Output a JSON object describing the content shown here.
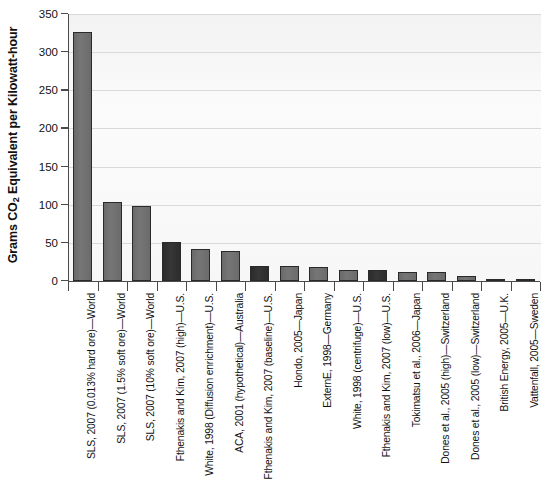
{
  "chart_data": {
    "type": "bar",
    "title": "",
    "xlabel": "",
    "ylabel": "Grams CO2 Equivalent per Kilowatt-hour",
    "ylabel_parts": {
      "pre": "Grams CO",
      "sub": "2",
      "post": " Equivalent per Kilowatt-hour"
    },
    "ylim": [
      0,
      350
    ],
    "yticks": [
      0,
      50,
      100,
      150,
      200,
      250,
      300,
      350
    ],
    "ytick_labels": [
      "0",
      "50",
      "100",
      "150",
      "200",
      "250",
      "300",
      "350"
    ],
    "grid": true,
    "legend": "none",
    "categories": [
      "SLS, 2007 (0.013% hard ore)—World",
      "SLS, 2007 (1.5% soft ore)—World",
      "SLS, 2007 (10% soft ore)—World",
      "Fthenakis and Kim, 2007 (high)—U.S.",
      "White, 1998 (Diffusion enrichment)—U.S.",
      "ACA, 2001 (hypothetical)—Australia",
      "Fthenakis and Kim, 2007 (baseline)—U.S.",
      "Hondo, 2005—Japan",
      "ExternE, 1998—Germany",
      "White, 1998 (centrifuge)—U.S.",
      "Fthenakis and Kim, 2007 (low)—U.S.",
      "Tokimatsu et al., 2006—Japan",
      "Dones et al., 2005 (high)—Switzerland",
      "Dones et al., 2005 (low)—Switzerland",
      "British Energy, 2005—U.K.",
      "Vattenfall, 2005—Sweden"
    ],
    "values": [
      327,
      104,
      98,
      51,
      42,
      39,
      20,
      20,
      18,
      14,
      14,
      12,
      12,
      6,
      3,
      2
    ],
    "bar_shades": [
      "light",
      "light",
      "light",
      "dark",
      "light",
      "light",
      "dark",
      "light",
      "light",
      "light",
      "dark",
      "light",
      "light",
      "light",
      "light",
      "light"
    ],
    "colors": {
      "light_bar": "#6e6e6e",
      "dark_bar": "#2f2f2f",
      "gridline": "#d9d9d9",
      "plot_background": "#fafafa",
      "axis": "#4a4a4a"
    }
  }
}
